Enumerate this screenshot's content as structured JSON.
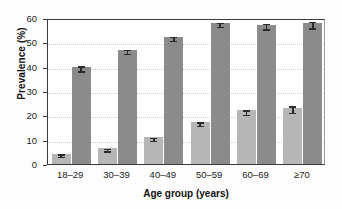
{
  "chart_data": {
    "type": "bar",
    "title": "",
    "xlabel": "Age group (years)",
    "ylabel": "Prevalence (%)",
    "categories": [
      "18–29",
      "30–39",
      "40–49",
      "50–59",
      "60–69",
      "≥70"
    ],
    "ylim": [
      0,
      60
    ],
    "yticks": [
      0,
      10,
      20,
      30,
      40,
      50,
      60
    ],
    "ytick_labels": [
      "0",
      "10",
      "20",
      "30",
      "40",
      "50",
      "60"
    ],
    "grid": true,
    "legend": "none",
    "series": [
      {
        "name": "light-series",
        "color": "#b6b6b6",
        "values": [
          4.3,
          6.5,
          11.0,
          17.3,
          22.0,
          23.2
        ],
        "errors": [
          0.5,
          0.5,
          0.7,
          0.7,
          0.9,
          1.3
        ]
      },
      {
        "name": "dark-series",
        "color": "#8b8b8b",
        "values": [
          39.9,
          47.0,
          52.3,
          58.0,
          57.3,
          57.9
        ],
        "errors": [
          1.0,
          0.8,
          0.8,
          0.8,
          1.2,
          1.3
        ]
      }
    ]
  },
  "style": {
    "axis_color": "#3a3a3a",
    "grid_color": "#cfcfcf",
    "error_color": "#2b2b2b",
    "background": "#ffffff"
  }
}
